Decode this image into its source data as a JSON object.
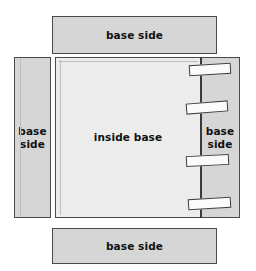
{
  "diagram": {
    "colors": {
      "panel_fill": "#d6d6d6",
      "inside_fill": "#ececec",
      "tab_fill": "#fbfbfb",
      "outline": "#4a4a4a",
      "fold_line": "#3a3a3a",
      "background": "#ffffff"
    },
    "panels": {
      "top": {
        "label": "base side"
      },
      "bottom": {
        "label": "base side"
      },
      "left": {
        "label": "base\nside"
      },
      "right": {
        "label": "base\nside"
      },
      "inside": {
        "label": "inside base"
      }
    },
    "tabs": [
      {
        "name": "tab-1"
      },
      {
        "name": "tab-2"
      },
      {
        "name": "tab-3"
      },
      {
        "name": "tab-4"
      }
    ]
  }
}
